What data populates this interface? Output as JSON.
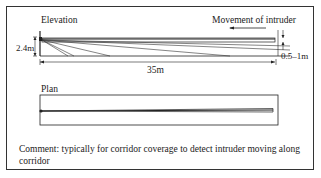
{
  "diagram": {
    "elevation": {
      "title": "Elevation",
      "height_label": "2.4m",
      "length_label": "35m",
      "width_label": "0.5–1m",
      "movement_label": "Movement of intruder"
    },
    "plan": {
      "title": "Plan"
    },
    "comment": "Comment: typically for corridor coverage to detect intruder moving along corridor",
    "colors": {
      "line": "#222222",
      "background": "#ffffff"
    }
  }
}
